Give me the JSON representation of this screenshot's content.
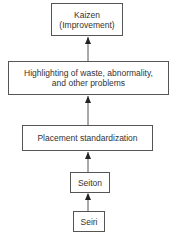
{
  "diagram": {
    "type": "flowchart-vertical",
    "direction": "bottom-to-top",
    "nodes": [
      {
        "id": "kaizen",
        "line1": "Kaizen",
        "line2": "(Improvement)"
      },
      {
        "id": "highlighting",
        "line1": "Highlighting of waste, abnormality,",
        "line2": "and other problems"
      },
      {
        "id": "placement",
        "line1": "Placement standardization"
      },
      {
        "id": "seiton",
        "line1": "Seiton"
      },
      {
        "id": "seiri",
        "line1": "Seiri"
      }
    ],
    "edges": [
      {
        "from": "seiri",
        "to": "seiton"
      },
      {
        "from": "seiton",
        "to": "placement"
      },
      {
        "from": "placement",
        "to": "highlighting"
      },
      {
        "from": "highlighting",
        "to": "kaizen"
      }
    ],
    "colors": {
      "line": "#555555",
      "text": "#333333",
      "background": "#ffffff"
    }
  }
}
